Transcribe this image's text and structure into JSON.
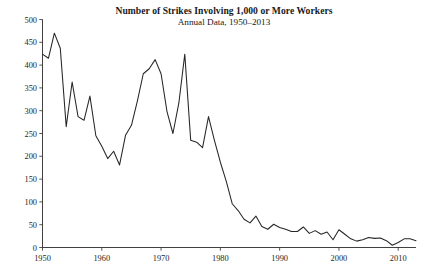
{
  "chart_data": {
    "type": "line",
    "title": "Number of Strikes Involving 1,000 or More Workers",
    "subtitle": "Annual Data, 1950–2013",
    "xlabel": "",
    "ylabel": "",
    "xlim": [
      1950,
      2013
    ],
    "ylim": [
      0,
      500
    ],
    "ytick_labels": [
      "0",
      "50",
      "100",
      "150",
      "200",
      "250",
      "300",
      "350",
      "400",
      "450",
      "500"
    ],
    "ytick_values": [
      0,
      50,
      100,
      150,
      200,
      250,
      300,
      350,
      400,
      450,
      500
    ],
    "xtick_labels": [
      "1950",
      "1960",
      "1970",
      "1980",
      "1990",
      "2000",
      "2010"
    ],
    "xtick_values": [
      1950,
      1960,
      1970,
      1980,
      1990,
      2000,
      2010
    ],
    "grid": false,
    "legend": false,
    "line_color": "#262626",
    "series": [
      {
        "name": "Strikes involving 1,000 or more workers",
        "x": [
          1950,
          1951,
          1952,
          1953,
          1954,
          1955,
          1956,
          1957,
          1958,
          1959,
          1960,
          1961,
          1962,
          1963,
          1964,
          1965,
          1966,
          1967,
          1968,
          1969,
          1970,
          1971,
          1972,
          1973,
          1974,
          1975,
          1976,
          1977,
          1978,
          1979,
          1980,
          1981,
          1982,
          1983,
          1984,
          1985,
          1986,
          1987,
          1988,
          1989,
          1990,
          1991,
          1992,
          1993,
          1994,
          1995,
          1996,
          1997,
          1998,
          1999,
          2000,
          2001,
          2002,
          2003,
          2004,
          2005,
          2006,
          2007,
          2008,
          2009,
          2010,
          2011,
          2012,
          2013
        ],
        "values": [
          424,
          415,
          470,
          437,
          265,
          363,
          287,
          279,
          332,
          245,
          222,
          195,
          211,
          181,
          246,
          268,
          321,
          381,
          392,
          412,
          381,
          298,
          250,
          317,
          424,
          235,
          231,
          219,
          287,
          235,
          187,
          145,
          96,
          81,
          62,
          54,
          69,
          46,
          40,
          51,
          44,
          40,
          35,
          35,
          45,
          31,
          37,
          29,
          34,
          17,
          39,
          29,
          19,
          14,
          17,
          22,
          20,
          21,
          15,
          5,
          11,
          19,
          19,
          15
        ]
      }
    ]
  }
}
